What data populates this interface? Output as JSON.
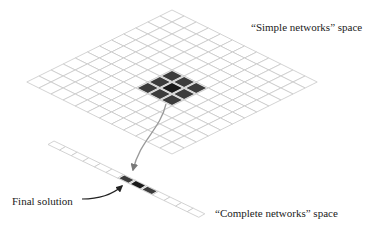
{
  "labels": {
    "simple_space": "“Simple networks” space",
    "complete_space": "“Complete networks” space",
    "final_solution": "Final solution"
  },
  "colors": {
    "grid_line": "#c8c8c8",
    "cell_dark": "#3c3c3c",
    "cell_darkest": "#1a1a1a",
    "arrow_grey": "#9a9a9a",
    "arrow_dark": "#222222"
  },
  "simple_grid": {
    "cells_per_side": 12,
    "top": [
      172,
      10
    ],
    "step_a": [
      12.1,
      6.0
    ],
    "step_b": [
      -12.1,
      6.0
    ],
    "highlighted": [
      {
        "i": 5,
        "j": 5,
        "shade": "dark"
      },
      {
        "i": 5,
        "j": 6,
        "shade": "dark"
      },
      {
        "i": 5,
        "j": 7,
        "shade": "dark"
      },
      {
        "i": 6,
        "j": 5,
        "shade": "dark"
      },
      {
        "i": 6,
        "j": 6,
        "shade": "darkest"
      },
      {
        "i": 6,
        "j": 7,
        "shade": "dark"
      },
      {
        "i": 7,
        "j": 5,
        "shade": "dark"
      },
      {
        "i": 7,
        "j": 6,
        "shade": "dark"
      },
      {
        "i": 7,
        "j": 7,
        "shade": "dark"
      }
    ]
  },
  "complete_strip": {
    "cells": 13,
    "start": [
      54,
      141
    ],
    "step": [
      11.6,
      5.6
    ],
    "width": [
      -6,
      3.5
    ],
    "highlighted": [
      {
        "k": 6,
        "shade": "dark"
      },
      {
        "k": 7,
        "shade": "darkest"
      },
      {
        "k": 8,
        "shade": "dark"
      }
    ]
  }
}
